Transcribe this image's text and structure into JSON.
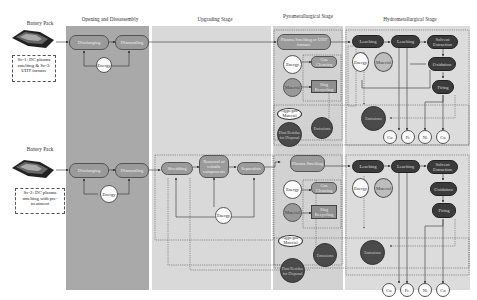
{
  "stages": {
    "battery_pack": "Battery Pack",
    "opening": "Opening and Dissassembly",
    "upgrading": "Upgrading Stage",
    "pyro": "Pyrometallurgical Stage",
    "hydro": "Hydrometallurgical Stage"
  },
  "colors": {
    "opening_bg": "#a9a9a9",
    "upgrading_bg": "#d9d9d9",
    "pyro_bg": "#d4d4d4",
    "hydro_bg": "#dcdcdc",
    "grey_node": "#9a9a9a",
    "dark_node": "#3b3b3b"
  },
  "scenario1": {
    "battery_label": "Battery Pack",
    "note": "Sc-1: DC plasma smelting & Sc-3: UHT furnace",
    "opening": {
      "discharging": "Discharging",
      "dismantling": "Dismantling",
      "energy": "Energy"
    },
    "pyro": {
      "smelting": "Plasma Smelting or UHT furnace",
      "energy": "Energy",
      "material": "Material",
      "gas_cleaning": "Gas Cleaning",
      "slag_recycling": "Slag Recycling",
      "aggregate": "Aggregate Material",
      "dust": "Dust Residue for Disposal",
      "emissions": "Emissions"
    },
    "hydro": {
      "leaching1": "Leaching",
      "leaching2": "Leaching",
      "solvent": "Solvent Extraction",
      "energy": "Energy",
      "material": "Material",
      "oxidation": "Oxidation",
      "firing": "Firing",
      "emissions": "Emissions",
      "products": [
        "Cu",
        "Fe",
        "Ni",
        "Co"
      ]
    }
  },
  "scenario2": {
    "battery_label": "Battery Pack",
    "note": "Sc-2: DC plasma smelting with pre-treatment",
    "opening": {
      "discharging": "Discharging",
      "dismantling": "Dismantling",
      "energy": "Energy"
    },
    "upgrading": {
      "shredding": "Shredding",
      "removal": "Removal of volatile components",
      "separation": "Separation",
      "energy": "Energy"
    },
    "pyro": {
      "smelting": "Plasma Smelting",
      "energy": "Energy",
      "material": "Material",
      "gas_cleaning": "Gas Cleaning",
      "slag_recycling": "Slag Recycling",
      "aggregate": "Aggregate Material",
      "dust": "Dust Residue for Disposal",
      "emissions": "Emissions"
    },
    "hydro": {
      "leaching1": "Leaching",
      "leaching2": "Leaching",
      "solvent": "Solvent Extraction",
      "energy": "Energy",
      "material": "Material",
      "oxidation": "Oxidation",
      "firing": "Firing",
      "emissions": "Emissions",
      "products": [
        "Cu",
        "Fe",
        "Ni",
        "Co"
      ]
    }
  }
}
